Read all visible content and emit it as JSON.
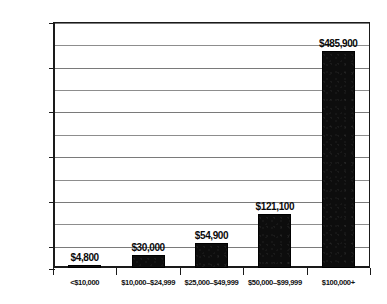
{
  "chart_data": {
    "type": "bar",
    "title": "",
    "subtitle": "",
    "xlabel": "",
    "ylabel": "",
    "categories": [
      "<$10,000",
      "$10,000–$24,999",
      "$25,000–$49,999",
      "$50,000–$99,999",
      "$100,000+"
    ],
    "values": [
      4800,
      30000,
      54900,
      121100,
      485900
    ],
    "value_labels": [
      "$4,800",
      "$30,000",
      "$54,900",
      "$121,100",
      "$485,900"
    ],
    "ylim": [
      0,
      550000
    ],
    "y_tick_step": 50000,
    "y_major_labels": [
      "$0",
      "$50,000",
      "$150,000",
      "$250,000",
      "$350,000",
      "$450,000",
      "$550,000"
    ],
    "y_major_values": [
      0,
      50000,
      150000,
      250000,
      350000,
      450000,
      550000
    ],
    "y_gridline_values": [
      0,
      50000,
      100000,
      150000,
      200000,
      250000,
      300000,
      350000,
      400000,
      450000,
      500000,
      550000
    ],
    "grid": true,
    "legend": false,
    "legend_position": "none",
    "bar_color": "#0d0d0d",
    "gridline_color": "#8d8d8d",
    "axis_color": "#1a1a1a",
    "background_color": "#ffffff",
    "text_color": "#111111"
  }
}
